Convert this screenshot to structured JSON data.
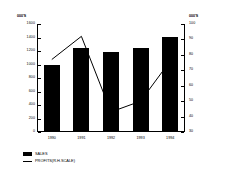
{
  "chart_data": {
    "type": "bar",
    "title": "",
    "subtitle": "",
    "categories": [
      "1990",
      "1991",
      "1992",
      "1993",
      "1994"
    ],
    "xlabel": "",
    "ylabel": "000'S",
    "y2label": "000'S",
    "ylim": [
      0,
      1600
    ],
    "y2lim": [
      30,
      100
    ],
    "yticks": [
      "1600",
      "1400",
      "1200",
      "1000",
      "800",
      "600",
      "400",
      "200",
      "0"
    ],
    "ytick_values": [
      1600,
      1400,
      1200,
      1000,
      800,
      600,
      400,
      200,
      0
    ],
    "y2ticks": [
      "100",
      "90",
      "80",
      "70",
      "60",
      "50",
      "40",
      "30"
    ],
    "y2tick_values": [
      100,
      90,
      80,
      70,
      60,
      50,
      40,
      30
    ],
    "grid": false,
    "legend_position": "bottom-left",
    "series": [
      {
        "name": "SALES",
        "type": "bar",
        "axis": "left",
        "color": "#000000",
        "values": [
          1000,
          1240,
          1180,
          1245,
          1410
        ]
      },
      {
        "name": "PROFITS(R.H.SCALE)",
        "type": "line",
        "axis": "right",
        "color": "#000000",
        "values": [
          77,
          92,
          43,
          50,
          76
        ]
      }
    ],
    "legend": [
      {
        "label": "SALES",
        "marker": "filled-square",
        "color": "#000000"
      },
      {
        "label": "PROFITS(R.H.SCALE)",
        "marker": "line",
        "color": "#000000"
      }
    ]
  },
  "axes": {
    "left_header": "000'S",
    "right_header": "000'S"
  }
}
